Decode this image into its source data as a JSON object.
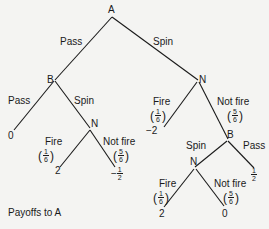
{
  "diagram": {
    "type": "game-tree",
    "caption": "Payoffs to A",
    "nodes": {
      "root": "A",
      "b1": "B",
      "n1": "N",
      "n2": "N",
      "b2": "B",
      "n3": "N"
    },
    "edges": {
      "a_pass": "Pass",
      "a_spin": "Spin",
      "b1_pass": "Pass",
      "b1_spin": "Spin",
      "n1_fire": "Fire",
      "n1_notfire": "Not fire",
      "n2_fire": "Fire",
      "n2_notfire": "Not fire",
      "b2_spin": "Spin",
      "b2_pass": "Pass",
      "n3_fire": "Fire",
      "n3_notfire": "Not fire"
    },
    "probabilities": {
      "fire": {
        "num": "1",
        "den": "6"
      },
      "not_fire": {
        "num": "5",
        "den": "6"
      }
    },
    "payoffs": {
      "b1_pass": "0",
      "n2_fire": "2",
      "n2_notfire_sign": "−",
      "n2_notfire_num": "1",
      "n2_notfire_den": "2",
      "n1_fire": "−2",
      "b2_pass_num": "1",
      "b2_pass_den": "2",
      "n3_fire": "2",
      "n3_notfire": "0"
    },
    "colors": {
      "background": "#f4f4f2",
      "ink": "#1a1a1a"
    }
  }
}
